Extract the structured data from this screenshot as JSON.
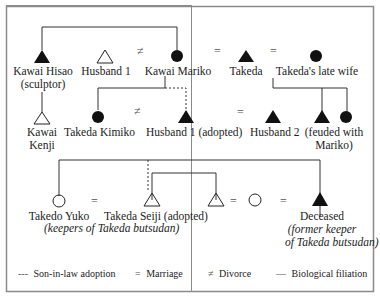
{
  "diagram": {
    "type": "kinship",
    "people": {
      "kawai_hisao": {
        "name": "Kawai Hisao",
        "note": "(sculptor)",
        "symbol": "filled-triangle"
      },
      "husband1_top": {
        "name": "Husband 1",
        "symbol": "open-triangle"
      },
      "kawai_mariko": {
        "name": "Kawai Mariko",
        "symbol": "filled-circle"
      },
      "takeda": {
        "name": "Takeda",
        "symbol": "filled-triangle"
      },
      "takedas_late_wife": {
        "name": "Takeda's late wife",
        "symbol": "filled-circle"
      },
      "kawai_kenji": {
        "name_line1": "Kawai",
        "name_line2": "Kenji",
        "symbol": "open-triangle"
      },
      "takeda_kimiko": {
        "name": "Takeda Kimiko",
        "symbol": "filled-circle"
      },
      "husband1_adopted": {
        "name": "Husband 1 (adopted)",
        "symbol": "filled-triangle"
      },
      "husband2": {
        "name": "Husband 2",
        "symbol": "filled-triangle"
      },
      "feuded_siblings": {
        "note_line1": "(feuded with",
        "note_line2": "Mariko)",
        "symbols": [
          "filled-triangle",
          "filled-circle"
        ]
      },
      "takedo_yuko": {
        "name": "Takedo Yuko",
        "symbol": "open-circle"
      },
      "takeda_seiji": {
        "name": "Takeda Seiji (adopted)",
        "symbol": "open-triangle"
      },
      "keepers_note": "(keepers of Takeda butsudan)",
      "seiji_sibling": {
        "symbol": "open-triangle"
      },
      "sibling_spouse": {
        "symbol": "open-circle"
      },
      "deceased": {
        "name": "Deceased",
        "note_line1": "(former keeper",
        "note_line2": "of Takeda butsudan)",
        "symbol": "filled-triangle"
      }
    },
    "symbols": {
      "marriage": "=",
      "divorce": "≠"
    }
  },
  "legend": {
    "adoption": {
      "glyph": "---",
      "label": "Son-in-law adoption"
    },
    "marriage": {
      "glyph": "=",
      "label": "Marriage"
    },
    "divorce": {
      "glyph": "≠",
      "label": "Divorce"
    },
    "filiation": {
      "glyph": "—",
      "label": "Biological filiation"
    }
  }
}
